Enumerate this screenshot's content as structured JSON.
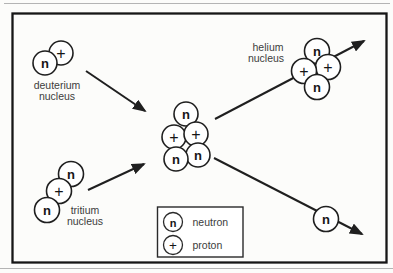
{
  "colors": {
    "paper": "#fcfcfa",
    "ink": "#1f1f1f",
    "label_text": "#3c3c3c",
    "scan_artifact": "#b4b4b4"
  },
  "particles": {
    "deuterium": [
      "n",
      "+"
    ],
    "tritium": [
      "n",
      "+",
      "n"
    ],
    "compound": [
      "n",
      "+",
      "+",
      "n",
      "n"
    ],
    "helium": [
      "n",
      "+",
      "+",
      "n"
    ],
    "free_neutron": "n"
  },
  "labels": {
    "deuterium": [
      "deuterium",
      "nucleus"
    ],
    "tritium": [
      "tritium",
      "nucleus"
    ],
    "helium": [
      "helium",
      "nucleus"
    ]
  },
  "legend": {
    "items": [
      {
        "symbol": "n",
        "label": "neutron"
      },
      {
        "symbol": "+",
        "label": "proton"
      }
    ]
  }
}
